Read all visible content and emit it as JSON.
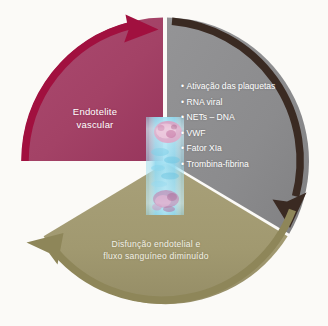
{
  "figure": {
    "type": "cycle-diagram",
    "background_color": "#fbfaf7",
    "center": {
      "x": 165,
      "y": 161,
      "radius": 144
    },
    "center_image": {
      "name": "vessel-micrograph",
      "description": "vertical blood vessel micrograph, cyan lumen with pink cells",
      "colors": [
        "#7fd3e8",
        "#a9e2f2",
        "#d98ab4",
        "#b05a92",
        "#e0c0d8"
      ]
    },
    "sectors": [
      {
        "id": "endothelitis",
        "label": "Endotelite\nvascular",
        "label_line1": "Endotelite",
        "label_line2": "vascular",
        "color": "#a54268",
        "arrow_color": "#a1103f",
        "start_angle_deg": 180,
        "end_angle_deg": 300,
        "arrow_direction": "clockwise",
        "arrowhead_position": "top-left"
      },
      {
        "id": "activation",
        "label": "",
        "color": "#8d8d8f",
        "arrow_color": "#3a2a22",
        "start_angle_deg": 300,
        "end_angle_deg": 60,
        "arrow_direction": "clockwise",
        "arrowhead_position": "bottom-right",
        "bullets": [
          "Ativação das plaquetas",
          "RNA viral",
          "NETs – DNA",
          "VWF",
          "Fator XIa",
          "Trombina-fibrina"
        ],
        "bullet_glyph": "•"
      },
      {
        "id": "dysfunction",
        "label": "Disfunção endotelial e\nfluxo sanguíneo diminuído",
        "label_line1": "Disfunção endotelial e",
        "label_line2": "fluxo sanguíneo diminuído",
        "color": "#a39b73",
        "arrow_color": "#8e8659",
        "start_angle_deg": 60,
        "end_angle_deg": 180,
        "arrow_direction": "clockwise",
        "arrowhead_position": "bottom-left"
      }
    ]
  }
}
